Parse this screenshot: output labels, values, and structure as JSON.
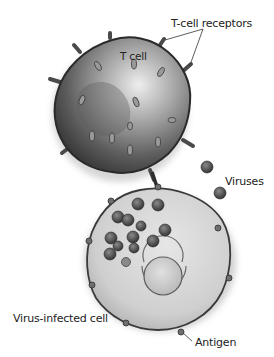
{
  "figure": {
    "type": "illustration",
    "style": "grayscale",
    "labels": {
      "t_cell_receptors": "T-cell receptors",
      "t_cell": "T cell",
      "viruses": "Viruses",
      "virus_infected_cell": "Virus-infected cell",
      "antigen": "Antigen"
    },
    "colors": {
      "background": "#ffffff",
      "text": "#222222",
      "tcell_dark": "#3a3a3a",
      "tcell_mid": "#7a7a7a",
      "tcell_light": "#d8d8d8",
      "infected_cell_fill": "#d6d6d6",
      "virus": "#4a4a4a"
    },
    "elements": {
      "free_virus_count": 2,
      "internal_virus_count": 13,
      "antigen_bump_count": 8
    }
  }
}
